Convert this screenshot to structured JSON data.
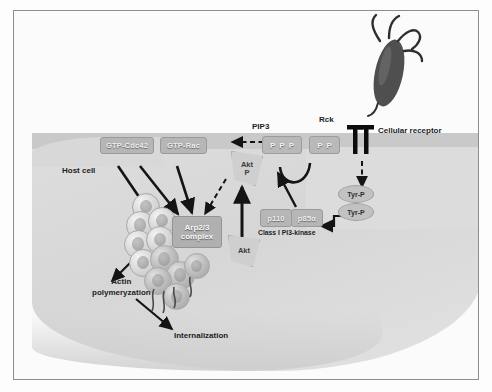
{
  "figure": {
    "type": "biological-signaling-diagram"
  },
  "labels": {
    "host_cell": "Host cell",
    "rck": "Rck",
    "cellular_receptor": "Cellular receptor",
    "pip3": "PIP3",
    "actin_polymerization": "Actin\npolymeryzation",
    "actin_polymerization_line1": "Actin",
    "actin_polymerization_line2": "polymeryzation",
    "internalization": "Internalization",
    "class_pi3k": "Class I PI3-kinase"
  },
  "nodes": {
    "gtp_cdc42": "GTP-Cdc42",
    "gtp_rac": "GTP-Rac",
    "arp23_line1": "Arp2/3",
    "arp23_line2": "complex",
    "akt_phos_line1": "Akt",
    "akt_phos_line2": "P",
    "akt_line1": "Akt",
    "p110": "p110",
    "p85a": "p85α",
    "pip3_box": [
      "P",
      "P",
      "P"
    ],
    "pip2_box": [
      "P",
      "P"
    ],
    "tyr_p_upper": "Tyr-P",
    "tyr_p_lower": "Tyr-P"
  },
  "icons": {
    "bacterium": "bacterium-icon",
    "receptor": "transmembrane-receptor-icon",
    "actin_filament": "actin-filament-icon"
  },
  "colors": {
    "cell_fill": "#dcdcdc",
    "membrane": "#c9c9c9",
    "protein_box": "#b6b6b6",
    "bacterium": "#4f4f4f",
    "arrow": "#141414",
    "frame_border": "#8d8d8d",
    "page_background": "#fdfdfd"
  }
}
